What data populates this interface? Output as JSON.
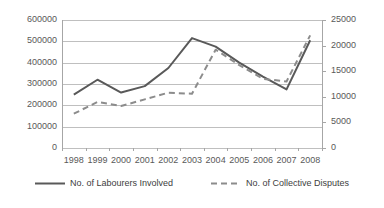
{
  "chart_data": {
    "type": "line",
    "title": "",
    "subtitle": "",
    "xlabel": "",
    "ylabel": "",
    "grid": true,
    "legend_position": "bottom",
    "categories": [
      "1998",
      "1999",
      "2000",
      "2001",
      "2002",
      "2003",
      "2004",
      "2005",
      "2006",
      "2007",
      "2008"
    ],
    "axes": {
      "left": {
        "label": "",
        "ylim": [
          0,
          600000
        ],
        "ticks": [
          0,
          100000,
          200000,
          300000,
          400000,
          500000,
          600000
        ],
        "tick_labels": [
          "0",
          "100000",
          "200000",
          "300000",
          "400000",
          "500000",
          "600000"
        ]
      },
      "right": {
        "label": "",
        "ylim": [
          0,
          25000
        ],
        "ticks": [
          0,
          5000,
          10000,
          15000,
          20000,
          25000
        ],
        "tick_labels": [
          "0",
          "5000",
          "10000",
          "15000",
          "20000",
          "25000"
        ]
      }
    },
    "series": [
      {
        "name": "No. of Labourers Involved",
        "axis": "left",
        "style": "solid",
        "color": "#595959",
        "values": [
          250000,
          320000,
          260000,
          290000,
          375000,
          515000,
          475000,
          400000,
          335000,
          275000,
          505000
        ]
      },
      {
        "name": "No. of Collective Disputes",
        "axis": "right",
        "style": "dashed",
        "color": "#8c8c8c",
        "values": [
          6700,
          9000,
          8200,
          9500,
          10800,
          10600,
          19200,
          16200,
          13500,
          13000,
          22000
        ]
      }
    ]
  },
  "legend": {
    "entries": [
      {
        "label": "No. of Labourers Involved",
        "style": "solid",
        "color": "#595959"
      },
      {
        "label": "No. of Collective Disputes",
        "style": "dashed",
        "color": "#8c8c8c"
      }
    ]
  },
  "colors": {
    "gridline": "#bfbfbf",
    "axis_line": "#a6a6a6",
    "tick_text": "#595959",
    "legend_text": "#404040",
    "background": "#ffffff"
  }
}
